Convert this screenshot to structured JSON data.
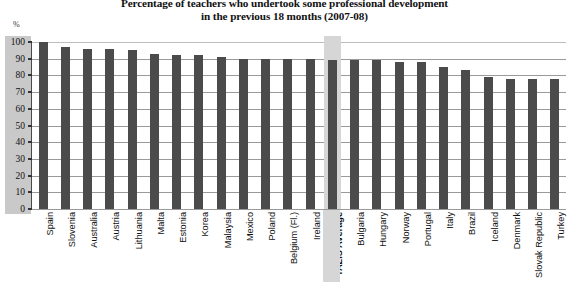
{
  "chart_data": {
    "type": "bar",
    "title": "Percentage of teachers who undertook some professional development in the previous 18 months  (2007-08)",
    "title_line1": "Percentage of teachers who undertook some professional development",
    "title_line2": "in the previous 18 months  (2007-08)",
    "xlabel": "",
    "ylabel": "%",
    "ylim": [
      0,
      100
    ],
    "yticks": [
      100,
      90,
      80,
      70,
      60,
      50,
      40,
      30,
      20,
      10,
      0
    ],
    "grid": true,
    "legend": "none",
    "bar_color": "#4b4b4b",
    "highlight_color": "#d6d6d6",
    "highlight_category": "TALIS Average",
    "categories": [
      "Spain",
      "Slovenia",
      "Australia",
      "Austria",
      "Lithuania",
      "Malta",
      "Estonia",
      "Korea",
      "Malaysia",
      "Mexico",
      "Poland",
      "Belgium (Fl.)",
      "Ireland",
      "TALIS Average",
      "Bulgaria",
      "Hungary",
      "Norway",
      "Portugal",
      "Italy",
      "Brazil",
      "Iceland",
      "Denmark",
      "Slovak Republic",
      "Turkey"
    ],
    "values": [
      100,
      97,
      96,
      96,
      95,
      93,
      92,
      92,
      91,
      90,
      90,
      90,
      90,
      89,
      89,
      89,
      88,
      88,
      85,
      83,
      79,
      78,
      78,
      78
    ]
  }
}
